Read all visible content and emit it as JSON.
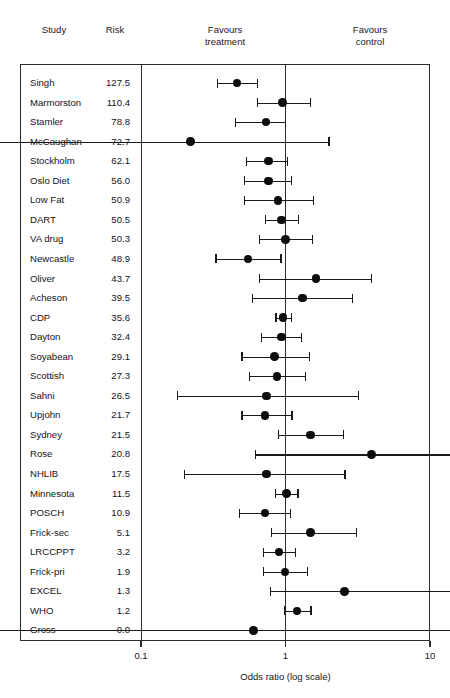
{
  "header": {
    "study_label": "Study",
    "risk_label": "Risk",
    "favours_treatment_label": "Favours\ntreatment",
    "favours_control_label": "Favours\ncontrol"
  },
  "axis": {
    "title": "Odds ratio (log scale)",
    "ticks": [
      "0.1",
      "1",
      "10"
    ],
    "tick_values": [
      0.1,
      1,
      10
    ],
    "scale": "log",
    "min": 0.1,
    "max": 10
  },
  "colors": {
    "marker": "#0d0d0d",
    "line": "#1a1a1a",
    "frame": "#2b2b2b",
    "text": "#141414",
    "background": "#ffffff"
  },
  "chart_data": {
    "type": "scatter",
    "title": "",
    "subtitle": "",
    "xlabel": "Odds ratio (log scale)",
    "ylabel": "",
    "xscale": "log",
    "xlim": [
      0.1,
      10
    ],
    "grid": false,
    "legend": "none",
    "null_line": 1,
    "columns": [
      "Study",
      "Risk",
      "Odds ratio",
      "CI low",
      "CI high"
    ],
    "annotations": [
      "Favours treatment",
      "Favours control"
    ],
    "rows": [
      {
        "study": "Singh",
        "risk": "127.5",
        "or": 0.46,
        "lo": 0.34,
        "hi": 0.64,
        "clip_low": false,
        "clip_high": false
      },
      {
        "study": "Marmorston",
        "risk": "110.4",
        "or": 0.95,
        "lo": 0.64,
        "hi": 1.49,
        "clip_low": false,
        "clip_high": false
      },
      {
        "study": "Stamler",
        "risk": "78.8",
        "or": 0.73,
        "lo": 0.45,
        "hi": 1.0,
        "clip_low": false,
        "clip_high": false
      },
      {
        "study": "McCaughan",
        "risk": "72.7",
        "or": 0.22,
        "lo": 0.1,
        "hi": 2.0,
        "clip_low": true,
        "clip_high": false
      },
      {
        "study": "Stockholm",
        "risk": "62.1",
        "or": 0.76,
        "lo": 0.54,
        "hi": 1.03,
        "clip_low": false,
        "clip_high": false
      },
      {
        "study": "Oslo Diet",
        "risk": "56.0",
        "or": 0.76,
        "lo": 0.52,
        "hi": 1.1,
        "clip_low": false,
        "clip_high": false
      },
      {
        "study": "Low Fat",
        "risk": "50.9",
        "or": 0.89,
        "lo": 0.52,
        "hi": 1.56,
        "clip_low": false,
        "clip_high": false
      },
      {
        "study": "DART",
        "risk": "50.5",
        "or": 0.94,
        "lo": 0.73,
        "hi": 1.23,
        "clip_low": false,
        "clip_high": false
      },
      {
        "study": "VA drug",
        "risk": "50.3",
        "or": 1.0,
        "lo": 0.66,
        "hi": 1.53,
        "clip_low": false,
        "clip_high": false
      },
      {
        "study": "Newcastle",
        "risk": "48.9",
        "or": 0.55,
        "lo": 0.33,
        "hi": 0.93,
        "clip_low": false,
        "clip_high": false
      },
      {
        "study": "Oliver",
        "risk": "43.7",
        "or": 1.62,
        "lo": 0.66,
        "hi": 3.95,
        "clip_low": false,
        "clip_high": false
      },
      {
        "study": "Acheson",
        "risk": "39.5",
        "or": 1.31,
        "lo": 0.59,
        "hi": 2.9,
        "clip_low": false,
        "clip_high": false
      },
      {
        "study": "CDP",
        "risk": "35.6",
        "or": 0.96,
        "lo": 0.86,
        "hi": 1.1,
        "clip_low": false,
        "clip_high": false
      },
      {
        "study": "Dayton",
        "risk": "32.4",
        "or": 0.94,
        "lo": 0.68,
        "hi": 1.29,
        "clip_low": false,
        "clip_high": false
      },
      {
        "study": "Soyabean",
        "risk": "29.1",
        "or": 0.84,
        "lo": 0.5,
        "hi": 1.46,
        "clip_low": false,
        "clip_high": false
      },
      {
        "study": "Scottish",
        "risk": "27.3",
        "or": 0.87,
        "lo": 0.56,
        "hi": 1.38,
        "clip_low": false,
        "clip_high": false
      },
      {
        "study": "Sahni",
        "risk": "26.5",
        "or": 0.74,
        "lo": 0.18,
        "hi": 3.2,
        "clip_low": false,
        "clip_high": false
      },
      {
        "study": "Upjohn",
        "risk": "21.7",
        "or": 0.72,
        "lo": 0.5,
        "hi": 1.11,
        "clip_low": false,
        "clip_high": false
      },
      {
        "study": "Sydney",
        "risk": "21.5",
        "or": 1.49,
        "lo": 0.89,
        "hi": 2.53,
        "clip_low": false,
        "clip_high": false
      },
      {
        "study": "Rose",
        "risk": "20.8",
        "or": 3.95,
        "lo": 0.62,
        "hi": 10.0,
        "clip_low": false,
        "clip_high": true
      },
      {
        "study": "NHLIB",
        "risk": "17.5",
        "or": 0.74,
        "lo": 0.2,
        "hi": 2.58,
        "clip_low": false,
        "clip_high": false
      },
      {
        "study": "Minnesota",
        "risk": "11.5",
        "or": 1.02,
        "lo": 0.85,
        "hi": 1.22,
        "clip_low": false,
        "clip_high": false
      },
      {
        "study": "POSCH",
        "risk": "10.9",
        "or": 0.72,
        "lo": 0.48,
        "hi": 1.09,
        "clip_low": false,
        "clip_high": false
      },
      {
        "study": "Frick-sec",
        "risk": "5.1",
        "or": 1.49,
        "lo": 0.8,
        "hi": 3.1,
        "clip_low": false,
        "clip_high": false
      },
      {
        "study": "LRCCPPT",
        "risk": "3.2",
        "or": 0.9,
        "lo": 0.7,
        "hi": 1.18,
        "clip_low": false,
        "clip_high": false
      },
      {
        "study": "Frick-pri",
        "risk": "1.9",
        "or": 0.99,
        "lo": 0.7,
        "hi": 1.42,
        "clip_low": false,
        "clip_high": false
      },
      {
        "study": "EXCEL",
        "risk": "1.3",
        "or": 2.56,
        "lo": 0.79,
        "hi": 10.0,
        "clip_low": false,
        "clip_high": true
      },
      {
        "study": "WHO",
        "risk": "1.2",
        "or": 1.2,
        "lo": 0.98,
        "hi": 1.5,
        "clip_low": false,
        "clip_high": false
      },
      {
        "study": "Gross",
        "risk": "0.0",
        "or": 0.6,
        "lo": 0.1,
        "hi": 10.0,
        "clip_low": true,
        "clip_high": true
      }
    ]
  }
}
